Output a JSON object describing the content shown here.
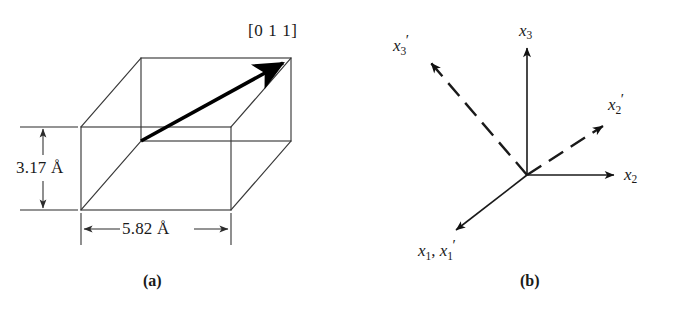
{
  "figure": {
    "background_color": "#ffffff",
    "line_color": "#2b2b2b",
    "vector_color": "#000000"
  },
  "panel_a": {
    "caption": "(a)",
    "direction_label": "[0 1 1]",
    "height_dimension": "3.17 Å",
    "width_dimension": "5.82 Å",
    "shape_name": "orthorhombic-unit-cell",
    "vector_name": "direction-vector-011",
    "dimensions": {
      "height_value": 3.17,
      "width_value": 5.82,
      "units": "Å"
    }
  },
  "panel_b": {
    "caption": "(b)",
    "axes": [
      {
        "id": "x3",
        "label_main": "x",
        "label_sub": "3",
        "label_prime": "",
        "style": "solid",
        "name": "axis-x3"
      },
      {
        "id": "x2",
        "label_main": "x",
        "label_sub": "2",
        "label_prime": "",
        "style": "solid",
        "name": "axis-x2"
      },
      {
        "id": "x1x1p",
        "label_main": "x",
        "label_sub": "1",
        "label_prime": "",
        "style": "solid",
        "name": "axis-x1-x1prime"
      },
      {
        "id": "x3p",
        "label_main": "x",
        "label_sub": "3",
        "label_prime": "′",
        "style": "dashed",
        "name": "axis-x3-prime"
      },
      {
        "id": "x2p",
        "label_main": "x",
        "label_sub": "2",
        "label_prime": "′",
        "style": "dashed",
        "name": "axis-x2-prime"
      }
    ],
    "labels": {
      "x3": {
        "main": "x",
        "sub": "3",
        "prime": ""
      },
      "x2": {
        "main": "x",
        "sub": "2",
        "prime": ""
      },
      "x3p": {
        "main": "x",
        "sub": "3",
        "prime": "′"
      },
      "x2p": {
        "main": "x",
        "sub": "2",
        "prime": "′"
      },
      "x1_first": {
        "main": "x",
        "sub": "1",
        "prime": ""
      },
      "x1_second": {
        "main": "x",
        "sub": "1",
        "prime": "′"
      },
      "x1_separator": ", "
    }
  }
}
